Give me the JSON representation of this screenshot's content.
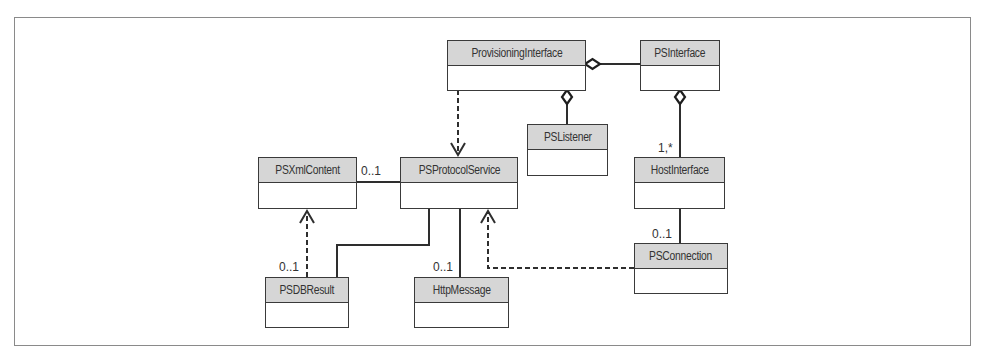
{
  "diagram": {
    "type": "UML class diagram",
    "colors": {
      "header_fill": "#d6d6d6",
      "border": "#3a3a3a",
      "frame": "#8a8a8a"
    },
    "classes": [
      {
        "id": "provisioning_interface",
        "name": "ProvisioningInterface"
      },
      {
        "id": "ps_interface",
        "name": "PSInterface"
      },
      {
        "id": "ps_listener",
        "name": "PSListener"
      },
      {
        "id": "host_interface",
        "name": "HostInterface"
      },
      {
        "id": "ps_xml_content",
        "name": "PSXmlContent"
      },
      {
        "id": "ps_protocol_service",
        "name": "PSProtocolService"
      },
      {
        "id": "ps_connection",
        "name": "PSConnection"
      },
      {
        "id": "psdb_result",
        "name": "PSDBResult"
      },
      {
        "id": "http_message",
        "name": "HttpMessage"
      }
    ],
    "relationships": [
      {
        "from": "ProvisioningInterface",
        "to": "PSInterface",
        "kind": "aggregation",
        "diamond_at": "ProvisioningInterface"
      },
      {
        "from": "ProvisioningInterface",
        "to": "PSListener",
        "kind": "aggregation",
        "diamond_at": "ProvisioningInterface"
      },
      {
        "from": "PSInterface",
        "to": "HostInterface",
        "kind": "aggregation",
        "diamond_at": "PSInterface",
        "multiplicity": "1,*"
      },
      {
        "from": "ProvisioningInterface",
        "to": "PSProtocolService",
        "kind": "dependency"
      },
      {
        "from": "PSProtocolService",
        "to": "PSXmlContent",
        "kind": "association",
        "multiplicity": "0..1"
      },
      {
        "from": "PSProtocolService",
        "to": "PSDBResult",
        "kind": "association",
        "multiplicity": "0..1"
      },
      {
        "from": "PSProtocolService",
        "to": "HttpMessage",
        "kind": "association",
        "multiplicity": "0..1"
      },
      {
        "from": "PSDBResult",
        "to": "PSXmlContent",
        "kind": "dependency"
      },
      {
        "from": "HostInterface",
        "to": "PSConnection",
        "kind": "association",
        "multiplicity": "0..1"
      },
      {
        "from": "PSConnection",
        "to": "PSProtocolService",
        "kind": "dependency"
      }
    ],
    "multiplicity_labels": {
      "host_interface": "1,*",
      "xml_content": "0..1",
      "psdb_result": "0..1",
      "http_message": "0..1",
      "ps_connection": "0..1"
    }
  }
}
